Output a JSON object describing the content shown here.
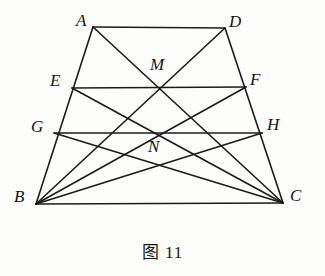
{
  "figure": {
    "caption": "图 11",
    "caption_position": {
      "y": 238
    },
    "canvas": {
      "width": 325,
      "height": 276
    },
    "stroke_color": "#1b1b1b",
    "background_color": "#fdfdfc",
    "label_color": "#131313"
  },
  "points": {
    "A": {
      "label": "A",
      "x": 93,
      "y": 27,
      "label_x": 76,
      "label_y": 12
    },
    "D": {
      "label": "D",
      "x": 225,
      "y": 28,
      "label_x": 229,
      "label_y": 13
    },
    "B": {
      "label": "B",
      "x": 36,
      "y": 204,
      "label_x": 14,
      "label_y": 188
    },
    "C": {
      "label": "C",
      "x": 283,
      "y": 203,
      "label_x": 290,
      "label_y": 187
    },
    "E": {
      "label": "E",
      "x": 72,
      "y": 88,
      "label_x": 50,
      "label_y": 72
    },
    "F": {
      "label": "F",
      "x": 246,
      "y": 87,
      "label_x": 250,
      "label_y": 71
    },
    "G": {
      "label": "G",
      "x": 54,
      "y": 133,
      "label_x": 31,
      "label_y": 118
    },
    "H": {
      "label": "H",
      "x": 262,
      "y": 133,
      "label_x": 267,
      "label_y": 116
    },
    "M": {
      "label": "M",
      "x": 159,
      "y": 88,
      "label_x": 150,
      "label_y": 56
    },
    "N": {
      "label": "N",
      "x": 157,
      "y": 135,
      "label_x": 148,
      "label_y": 138
    }
  },
  "segments": [
    {
      "name": "AD",
      "from": "A",
      "to": "D"
    },
    {
      "name": "AB",
      "from": "A",
      "to": "B"
    },
    {
      "name": "DC",
      "from": "D",
      "to": "C"
    },
    {
      "name": "BC",
      "from": "B",
      "to": "C"
    },
    {
      "name": "EF",
      "from": "E",
      "to": "F"
    },
    {
      "name": "GH",
      "from": "G",
      "to": "H"
    },
    {
      "name": "AC",
      "from": "A",
      "to": "C"
    },
    {
      "name": "BD",
      "from": "B",
      "to": "D"
    },
    {
      "name": "EC",
      "from": "E",
      "to": "C"
    },
    {
      "name": "BF",
      "from": "B",
      "to": "F"
    },
    {
      "name": "GC",
      "from": "G",
      "to": "C"
    },
    {
      "name": "BH",
      "from": "B",
      "to": "H"
    }
  ]
}
